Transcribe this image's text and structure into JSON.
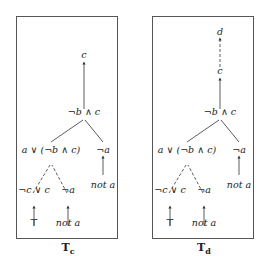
{
  "figure": {
    "panels": [
      {
        "id": "Tc",
        "caption_main": "T",
        "caption_sub": "c",
        "nodes": {
          "root": "c",
          "conj": "¬b ∧ c",
          "left": "a ∨ (¬b ∧ c)",
          "right": "¬a",
          "right_leaf": "not a",
          "ll": "¬c ∨ c",
          "lr": "¬a",
          "ll_leaf": "⊤",
          "lr_leaf": "not a"
        }
      },
      {
        "id": "Td",
        "caption_main": "T",
        "caption_sub": "d",
        "nodes": {
          "top": "d",
          "root": "c",
          "conj": "¬b ∧ c",
          "left": "a ∨ (¬b ∧ c)",
          "right": "¬a",
          "right_leaf": "not a",
          "ll": "¬c ∨ c",
          "lr": "¬a",
          "ll_leaf": "⊤",
          "lr_leaf": "not a"
        }
      }
    ]
  }
}
